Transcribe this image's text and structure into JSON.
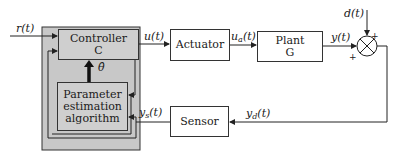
{
  "diagram": {
    "type": "adaptive-control-block-diagram",
    "colors": {
      "outer_frame": "#c8c8c8",
      "inner_box": "#cfcfcf",
      "line": "#333333"
    },
    "blocks": {
      "controller": {
        "line1": "Controller",
        "line2": "C"
      },
      "param_estimation": {
        "line1": "Parameter",
        "line2": "estimation",
        "line3": "algorithm"
      },
      "actuator": {
        "label": "Actuator"
      },
      "plant": {
        "line1": "Plant",
        "line2": "G"
      },
      "sensor": {
        "label": "Sensor"
      }
    },
    "signals": {
      "reference": "r(t)",
      "control": "u(t)",
      "actuated": {
        "base": "u",
        "sub": "a",
        "tail": "(t)"
      },
      "output": "y(t)",
      "disturbance": "d(t)",
      "disturbed": {
        "base": "y",
        "sub": "d",
        "tail": "(t)"
      },
      "sensed": {
        "base": "y",
        "sub": "s",
        "tail": "(t)"
      },
      "theta_hat": "θ̂"
    },
    "summing_junction": {
      "plus_top": "+",
      "plus_left": "+"
    }
  }
}
